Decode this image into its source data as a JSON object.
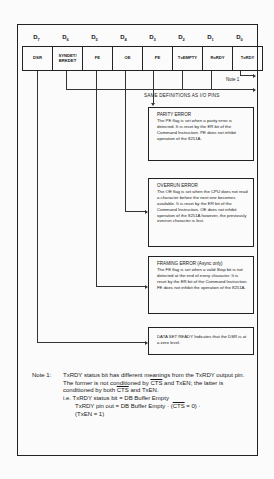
{
  "register": {
    "bits": [
      {
        "label": "D",
        "sub": "7",
        "name": "DSR"
      },
      {
        "label": "D",
        "sub": "6",
        "name": "SYNDET/ BRKDET"
      },
      {
        "label": "D",
        "sub": "5",
        "name": "FE"
      },
      {
        "label": "D",
        "sub": "4",
        "name": "OE"
      },
      {
        "label": "D",
        "sub": "3",
        "name": "PE"
      },
      {
        "label": "D",
        "sub": "2",
        "name": "TxEMPTY"
      },
      {
        "label": "D",
        "sub": "1",
        "name": "RxRDY"
      },
      {
        "label": "D",
        "sub": "0",
        "name": "TxRDY"
      }
    ],
    "note_tag": "Note 1",
    "same_definitions": "SAME DEFINITIONS AS I/O PINS"
  },
  "boxes": {
    "parity": {
      "title": "PARITY ERROR",
      "text": "The PE flag is set when a parity error is detected. It is reset by the ER bit of the Command Instruction. PE does not inhibit operation of the 8251A."
    },
    "overrun": {
      "title": "OVERRUN ERROR",
      "text": "The OE flag is set when the CPU does not read a character before the next one becomes available. It is reset by the ER bit of the Command Instruction. OE does not inhibit operation of the 8251A however, the previously overrun character is lost."
    },
    "framing": {
      "title": "FRAMING ERROR (Async only)",
      "text": "The FE flag is set when a valid Stop bit is not detected at the end of every character. It is reset by the ER bit of the Command Instruction. FE does not inhibit the operation of the 8251A."
    },
    "dsr": {
      "title": "DATA SET READY",
      "text": "Indicates that the DSR is at a zero level."
    }
  },
  "note": {
    "label": "Note 1:",
    "line1": "TxRDY status bit has different meanings from the TxRDY output pin. The former is not conditioned by ",
    "cts": "CTS",
    "line2": " and TxEN; the latter is conditioned by both ",
    "line3": " and TxEN.",
    "ie": "i.e. TxRDY status bit = DB Buffer Empty",
    "pin_prefix": "TxRDY pin out = DB Buffer Empty · (",
    "pin_suffix": " = 0) ·",
    "pin_line2": "(TxEN = 1)"
  }
}
